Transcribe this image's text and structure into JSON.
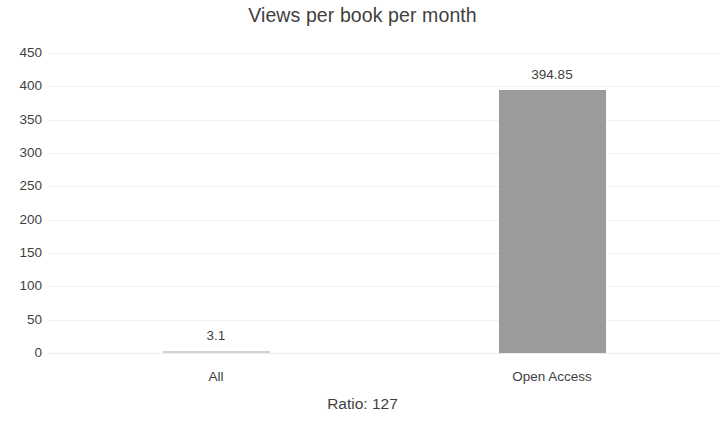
{
  "chart_data": {
    "type": "bar",
    "title": "Views per book per month",
    "xlabel": "",
    "ylabel": "",
    "categories": [
      "All",
      "Open Access"
    ],
    "values": [
      3.1,
      394.85
    ],
    "data_labels": [
      "3.1",
      "394.85"
    ],
    "ylim": [
      0,
      450
    ],
    "ytick_labels": [
      "450",
      "400",
      "350",
      "300",
      "250",
      "200",
      "150",
      "100",
      "50",
      "0"
    ],
    "ytick_values": [
      450,
      400,
      350,
      300,
      250,
      200,
      150,
      100,
      50,
      0
    ],
    "grid": true,
    "grid_axis": "y",
    "legend": false,
    "legend_position": "none",
    "series": [
      {
        "name": "Views per book per month",
        "values": [
          3.1,
          394.85
        ],
        "color": "#9b9b9b"
      }
    ],
    "annotations": [
      "Ratio: 127"
    ],
    "footer": "Ratio: 127",
    "colors": {
      "bar": "#9b9b9b",
      "text": "#3f3f3f",
      "gridline": "#f1f1f1",
      "background": "#ffffff"
    }
  }
}
